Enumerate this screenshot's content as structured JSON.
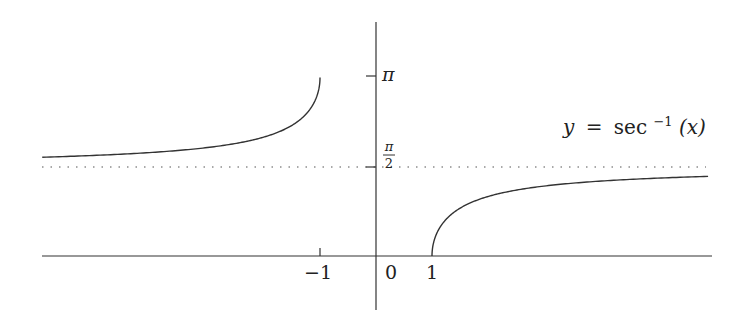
{
  "chart_data": {
    "type": "line",
    "title": "",
    "function_label": {
      "y": "y",
      "eq": "=",
      "fn": "sec",
      "sup": "−1",
      "arg": "(x)"
    },
    "xlabel": "",
    "ylabel": "",
    "x_ticks": [
      {
        "value": -1,
        "label": "−1"
      },
      {
        "value": 0,
        "label": "0"
      },
      {
        "value": 1,
        "label": "1"
      }
    ],
    "y_ticks": [
      {
        "value": 3.14159,
        "label": "π"
      },
      {
        "value": 1.5708,
        "label_num": "π",
        "label_den": "2"
      }
    ],
    "asymptote": {
      "y": 1.5708,
      "style": "dotted"
    },
    "xlim": [
      -5.96,
      6.0
    ],
    "ylim": [
      -0.9,
      3.9
    ],
    "series": [
      {
        "name": "left branch",
        "x_range": [
          -5.96,
          -1.0
        ],
        "description": "arcsec(x) for x ≤ -1, rising from ~1.74 toward π"
      },
      {
        "name": "right branch",
        "x_range": [
          1.0,
          5.93
        ],
        "description": "arcsec(x) for x ≥ 1, rising from 0 toward π/2"
      }
    ],
    "grid": false,
    "legend": "none"
  },
  "colors": {
    "curve": "#333333",
    "axis": "#333333",
    "dotted": "#555555"
  }
}
